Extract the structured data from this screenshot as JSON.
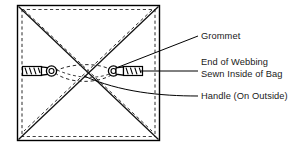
{
  "figure": {
    "colors": {
      "ink": "#1a1a1a",
      "line": "#000000",
      "background": "#ffffff"
    },
    "bag": {
      "name": "bag-body-square",
      "description": "Square bag shown flat from above with diagonal fold lines",
      "outline": {
        "x": 17,
        "y": 5,
        "width": 143,
        "height": 136
      },
      "seam_inset": 4,
      "diagonal_style": "solid",
      "webbing_path_style": "dashed"
    },
    "hardware": {
      "left_handle": {
        "name": "left-handle-assembly",
        "webbing_x": 22,
        "grommet_x": 50,
        "y": 71,
        "orientation": "webbing-left-grommet-right"
      },
      "right_handle": {
        "name": "right-handle-assembly",
        "webbing_x": 118,
        "grommet_x": 113,
        "y": 71,
        "orientation": "grommet-left-webbing-right"
      }
    },
    "labels": [
      {
        "id": "grommet",
        "text": "Grommet",
        "x": 201,
        "y": 39,
        "leader": "diagonal",
        "target": "right-grommet-ring"
      },
      {
        "id": "end-of-webbing",
        "line1": "End of Webbing",
        "line2": "Sewn Inside of Bag",
        "x": 201,
        "y": 65,
        "leader": "horizontal",
        "target": "right-webbing-end"
      },
      {
        "id": "handle",
        "text": "Handle (On Outside)",
        "x": 201,
        "y": 99,
        "leader": "curved",
        "target": "handle-webbing-center"
      }
    ]
  }
}
